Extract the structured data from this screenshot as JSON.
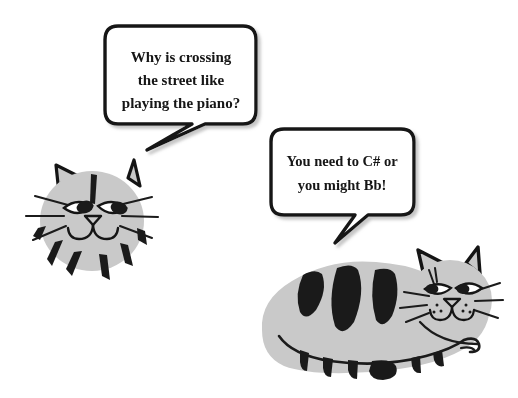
{
  "scene": {
    "title": "Cat Piano Joke Cartoon",
    "background_color": "#ffffff",
    "width": 518,
    "height": 398
  },
  "palette": {
    "fur_gray": "#c9c9c9",
    "stripe_black": "#1a1a1a",
    "outline_black": "#111111",
    "bubble_fill": "#ffffff",
    "bubble_outline": "#141414",
    "eye_white": "#ffffff",
    "shadow_gray": "#b5b5b5"
  },
  "speech_bubbles": [
    {
      "id": "bubble-question",
      "speaker": "left-cat",
      "lines": [
        "Why is crossing",
        "the street like",
        "playing the piano?"
      ],
      "full_text": "Why is crossing the street like playing the piano?"
    },
    {
      "id": "bubble-punchline",
      "speaker": "right-cat",
      "lines": [
        "You need to C# or",
        "you might Bb!"
      ],
      "full_text": "You need to C# or you might Bb!"
    }
  ],
  "characters": [
    {
      "id": "left-cat",
      "description": "gray striped cat head",
      "parts": [
        "ear-left",
        "ear-right",
        "head",
        "eye-left",
        "eye-right",
        "nose",
        "mouth",
        "whiskers",
        "stripes"
      ]
    },
    {
      "id": "right-cat",
      "description": "gray striped cat lying down, full body",
      "parts": [
        "body",
        "back-stripes",
        "tail",
        "tail-stripes",
        "head",
        "ear-left",
        "ear-right",
        "eye-left",
        "eye-right",
        "nose",
        "mouth",
        "whiskers",
        "freckles"
      ]
    }
  ]
}
